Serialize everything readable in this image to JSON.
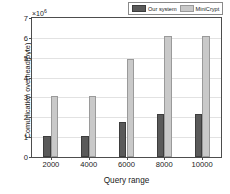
{
  "chart_data": {
    "type": "bar",
    "title": "",
    "xlabel": "Query range",
    "ylabel": "Comunication overhead(byte)",
    "axis_multiplier": "×10",
    "axis_multiplier_exponent": "6",
    "categories": [
      "2000",
      "4000",
      "6000",
      "8000",
      "10000"
    ],
    "series": [
      {
        "name": "Our system",
        "color": "#5a5a5a",
        "values": [
          1.08,
          1.08,
          1.77,
          2.18,
          2.18
        ]
      },
      {
        "name": "MiniCrypt",
        "color": "#c9c9c9",
        "values": [
          3.05,
          3.05,
          4.92,
          6.08,
          6.08
        ]
      }
    ],
    "ylim": [
      0,
      7
    ],
    "yticks": [
      "0",
      "1",
      "2",
      "3",
      "4",
      "5",
      "6",
      "7"
    ],
    "grid": true,
    "legend_position": "top-right"
  }
}
